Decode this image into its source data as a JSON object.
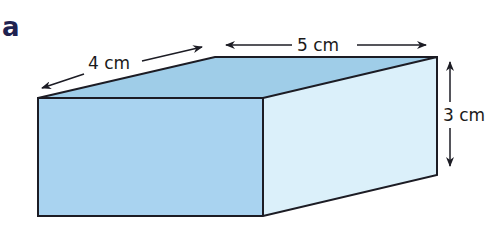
{
  "figure": {
    "part_label": "a",
    "shape": "cuboid",
    "colors": {
      "front_face": "#a9d3f0",
      "top_face": "#9fcde8",
      "side_face": "#dbf0fa",
      "edge": "#1c1c24",
      "arrow": "#1c1c24",
      "label_text": "#1a1a1a",
      "part_label_text": "#1f2250"
    },
    "dimensions": {
      "depth": {
        "label": "4 cm",
        "value": 4,
        "unit": "cm"
      },
      "length": {
        "label": "5 cm",
        "value": 5,
        "unit": "cm"
      },
      "height": {
        "label": "3 cm",
        "value": 3,
        "unit": "cm"
      }
    }
  }
}
